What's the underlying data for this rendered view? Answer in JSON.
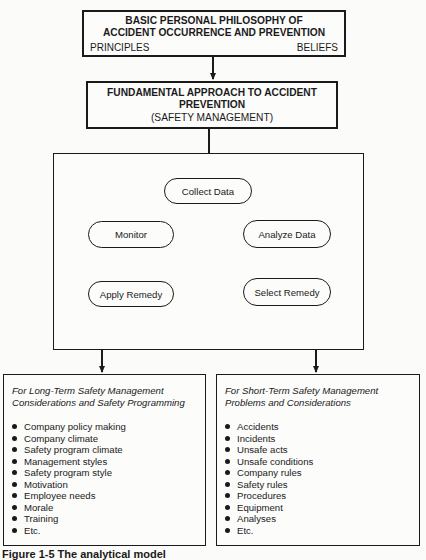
{
  "top_box": {
    "title_line1": "BASIC PERSONAL PHILOSOPHY OF",
    "title_line2": "ACCIDENT OCCURRENCE AND PREVENTION",
    "left_label": "PRINCIPLES",
    "right_label": "BELIEFS"
  },
  "approach_box": {
    "line1": "FUNDAMENTAL APPROACH TO ACCIDENT",
    "line2": "PREVENTION",
    "line3": "(SAFETY MANAGEMENT)"
  },
  "cycle": {
    "nodes": [
      {
        "id": "collect",
        "label": "Collect Data"
      },
      {
        "id": "analyze",
        "label": "Analyze Data"
      },
      {
        "id": "select",
        "label": "Select Remedy"
      },
      {
        "id": "apply",
        "label": "Apply Remedy"
      },
      {
        "id": "monitor",
        "label": "Monitor"
      }
    ],
    "flow": [
      "Collect Data",
      "Analyze Data",
      "Select Remedy",
      "Apply Remedy",
      "Monitor",
      "Collect Data"
    ]
  },
  "long_term": {
    "header_line1": "For Long-Term Safety Management",
    "header_line2": "Considerations and Safety Programming",
    "items": [
      "Company policy making",
      "Company climate",
      "Safety program climate",
      "Management styles",
      "Safety program style",
      "Motivation",
      "Employee needs",
      "Morale",
      "Training",
      "Etc."
    ]
  },
  "short_term": {
    "header_line1": "For Short-Term Safety Management",
    "header_line2": "Problems and Considerations",
    "items": [
      "Accidents",
      "Incidents",
      "Unsafe acts",
      "Unsafe conditions",
      "Company rules",
      "Safety rules",
      "Procedures",
      "Equipment",
      "Analyses",
      "Etc."
    ]
  },
  "caption": "Figure 1-5  The analytical model"
}
